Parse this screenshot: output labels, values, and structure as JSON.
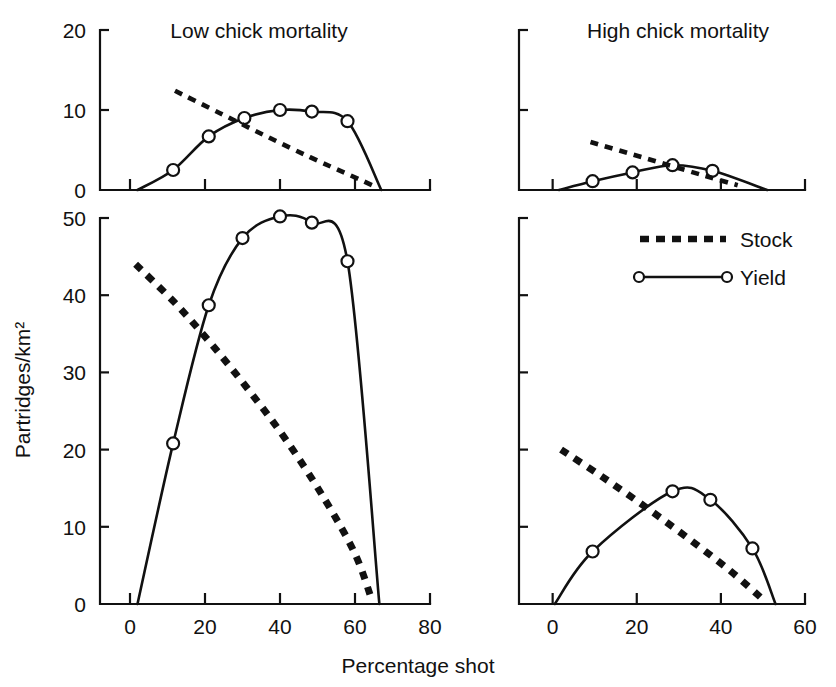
{
  "figure": {
    "x_axis_title": "Percentage shot",
    "y_axis_title": "Partridges/km²",
    "panel_titles": {
      "left": "Low chick mortality",
      "right": "High chick mortality"
    }
  },
  "legend": {
    "position": "upper-right-of-bottom-right-panel",
    "entries": [
      {
        "label": "Stock",
        "style": "thick-dotted-line"
      },
      {
        "label": "Yield",
        "style": "solid-line-with-open-circles"
      }
    ]
  },
  "colors": {
    "ink": "#111111",
    "background": "#ffffff",
    "marker_fill": "#ffffff"
  },
  "chart_data": {
    "type": "line",
    "title": "",
    "xlabel": "Percentage shot",
    "ylabel": "Partridges/km²",
    "grid": false,
    "legend_position": "inside upper right of bottom-right panel",
    "panels": [
      {
        "id": "top-left",
        "title": "Low chick mortality",
        "row": "top",
        "column": "left",
        "xlim": [
          -8,
          80
        ],
        "ylim": [
          0,
          20
        ],
        "xticks": [
          0,
          20,
          40,
          60,
          80
        ],
        "xticklabels": [
          "",
          "",
          "",
          "",
          ""
        ],
        "yticks": [
          0,
          10,
          20
        ],
        "yticklabels": [
          "0",
          "10",
          "20"
        ],
        "series": [
          {
            "name": "Yield",
            "style": "solid-line-with-open-circles",
            "markers": true,
            "points": [
              {
                "x": 11.5,
                "y": 2.5
              },
              {
                "x": 21.0,
                "y": 6.7
              },
              {
                "x": 30.5,
                "y": 9.0
              },
              {
                "x": 40.0,
                "y": 10.0
              },
              {
                "x": 48.5,
                "y": 9.8
              },
              {
                "x": 58.0,
                "y": 8.6
              }
            ],
            "curve_endpoints": [
              {
                "x": 2.0,
                "y": 0.0
              },
              {
                "x": 67.0,
                "y": 0.0
              }
            ]
          },
          {
            "name": "Stock",
            "style": "thick-dotted-line",
            "markers": false,
            "points": [
              {
                "x": 12.0,
                "y": 12.4
              },
              {
                "x": 24.0,
                "y": 9.6
              },
              {
                "x": 36.0,
                "y": 6.8
              },
              {
                "x": 48.0,
                "y": 4.1
              },
              {
                "x": 58.0,
                "y": 2.0
              },
              {
                "x": 65.0,
                "y": 0.5
              }
            ]
          }
        ]
      },
      {
        "id": "top-right",
        "title": "High chick mortality",
        "row": "top",
        "column": "right",
        "xlim": [
          -8,
          60
        ],
        "ylim": [
          0,
          20
        ],
        "xticks": [
          0,
          20,
          40,
          60
        ],
        "xticklabels": [
          "",
          "",
          "",
          ""
        ],
        "yticks": [
          0,
          10,
          20
        ],
        "yticklabels": [
          "",
          "",
          ""
        ],
        "series": [
          {
            "name": "Yield",
            "style": "solid-line-with-open-circles",
            "markers": true,
            "points": [
              {
                "x": 9.5,
                "y": 1.1
              },
              {
                "x": 19.0,
                "y": 2.2
              },
              {
                "x": 28.5,
                "y": 3.1
              },
              {
                "x": 38.0,
                "y": 2.4
              }
            ],
            "curve_endpoints": [
              {
                "x": 1.5,
                "y": 0.0
              },
              {
                "x": 51.0,
                "y": 0.0
              }
            ]
          },
          {
            "name": "Stock",
            "style": "thick-dotted-line",
            "markers": false,
            "points": [
              {
                "x": 9.0,
                "y": 6.0
              },
              {
                "x": 18.0,
                "y": 4.6
              },
              {
                "x": 27.0,
                "y": 3.2
              },
              {
                "x": 36.0,
                "y": 1.8
              },
              {
                "x": 44.0,
                "y": 0.6
              }
            ]
          }
        ]
      },
      {
        "id": "bottom-left",
        "title": "",
        "row": "bottom",
        "column": "left",
        "xlim": [
          -8,
          80
        ],
        "ylim": [
          0,
          50
        ],
        "xticks": [
          0,
          20,
          40,
          60,
          80
        ],
        "xticklabels": [
          "0",
          "20",
          "40",
          "60",
          "80"
        ],
        "yticks": [
          0,
          10,
          20,
          30,
          40,
          50
        ],
        "yticklabels": [
          "0",
          "10",
          "20",
          "30",
          "40",
          "50"
        ],
        "series": [
          {
            "name": "Yield",
            "style": "solid-line-with-open-circles",
            "markers": true,
            "points": [
              {
                "x": 11.5,
                "y": 20.8
              },
              {
                "x": 21.0,
                "y": 38.7
              },
              {
                "x": 30.0,
                "y": 47.4
              },
              {
                "x": 40.0,
                "y": 50.2
              },
              {
                "x": 48.5,
                "y": 49.4
              },
              {
                "x": 58.0,
                "y": 44.4
              }
            ],
            "curve_endpoints": [
              {
                "x": 2.0,
                "y": 0.0
              },
              {
                "x": 66.5,
                "y": 0.0
              }
            ]
          },
          {
            "name": "Stock",
            "style": "thick-dotted-line",
            "markers": false,
            "points": [
              {
                "x": 1.5,
                "y": 44.0
              },
              {
                "x": 12.0,
                "y": 39.0
              },
              {
                "x": 22.0,
                "y": 33.5
              },
              {
                "x": 32.0,
                "y": 27.5
              },
              {
                "x": 42.0,
                "y": 21.0
              },
              {
                "x": 52.0,
                "y": 13.5
              },
              {
                "x": 60.0,
                "y": 6.5
              },
              {
                "x": 64.5,
                "y": 0.5
              }
            ]
          }
        ]
      },
      {
        "id": "bottom-right",
        "title": "",
        "row": "bottom",
        "column": "right",
        "xlim": [
          -8,
          60
        ],
        "ylim": [
          0,
          50
        ],
        "xticks": [
          0,
          20,
          40,
          60
        ],
        "xticklabels": [
          "0",
          "20",
          "40",
          "60"
        ],
        "yticks": [
          0,
          10,
          20,
          30,
          40,
          50
        ],
        "yticklabels": [
          "",
          "",
          "",
          "",
          "",
          ""
        ],
        "series": [
          {
            "name": "Yield",
            "style": "solid-line-with-open-circles",
            "markers": true,
            "points": [
              {
                "x": 9.5,
                "y": 6.8
              },
              {
                "x": 28.5,
                "y": 14.6
              },
              {
                "x": 37.5,
                "y": 13.5
              },
              {
                "x": 47.5,
                "y": 7.2
              }
            ],
            "curve_endpoints": [
              {
                "x": 0.5,
                "y": 0.0
              },
              {
                "x": 53.0,
                "y": 0.0
              }
            ]
          },
          {
            "name": "Stock",
            "style": "thick-dotted-line",
            "markers": false,
            "points": [
              {
                "x": 2.0,
                "y": 20.0
              },
              {
                "x": 12.0,
                "y": 16.4
              },
              {
                "x": 22.0,
                "y": 12.6
              },
              {
                "x": 32.0,
                "y": 8.6
              },
              {
                "x": 42.0,
                "y": 4.4
              },
              {
                "x": 50.0,
                "y": 0.6
              }
            ]
          }
        ]
      }
    ]
  }
}
